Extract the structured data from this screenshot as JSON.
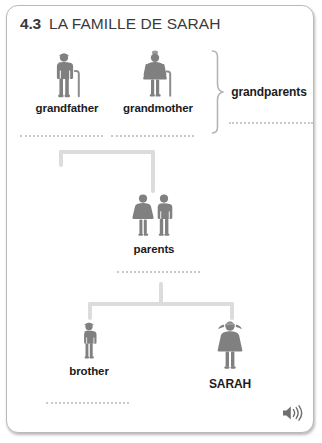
{
  "card": {
    "section_number": "4.3",
    "title": "LA FAMILLE DE SARAH"
  },
  "colors": {
    "figure_gray": "#808080",
    "connector_gray": "#dcdcdc",
    "dotted_gray": "#c9c9c9",
    "text_dark": "#1c1c1c",
    "title_gray": "#3a3a3a",
    "card_border": "#b9b9b9",
    "background": "#ffffff"
  },
  "tree": {
    "generation_1": [
      {
        "id": "grandfather",
        "label": "grandfather",
        "icon": "elderly-man-with-cane-icon"
      },
      {
        "id": "grandmother",
        "label": "grandmother",
        "icon": "elderly-woman-with-cane-icon"
      }
    ],
    "generation_1_bracket_label": "grandparents",
    "generation_2": [
      {
        "id": "parents",
        "label": "parents",
        "icon": "couple-icon"
      }
    ],
    "generation_3": [
      {
        "id": "brother",
        "label": "brother",
        "icon": "boy-icon"
      },
      {
        "id": "sarah",
        "label": "SARAH",
        "icon": "girl-icon"
      }
    ]
  },
  "answer_lines": [
    {
      "id": "grandfather-answer-line"
    },
    {
      "id": "grandmother-answer-line"
    },
    {
      "id": "grandparents-answer-line"
    },
    {
      "id": "parents-answer-line"
    },
    {
      "id": "brother-answer-line"
    }
  ],
  "audio": {
    "icon": "speaker-icon"
  }
}
